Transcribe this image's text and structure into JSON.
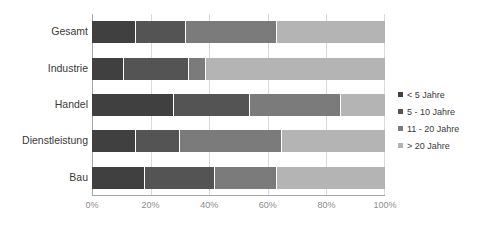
{
  "chart_data": {
    "type": "bar",
    "orientation": "horizontal",
    "stacked": true,
    "stack_mode": "percent",
    "title": "",
    "xlabel": "",
    "ylabel": "",
    "xlim": [
      0,
      100
    ],
    "xticks": [
      "0%",
      "20%",
      "40%",
      "60%",
      "80%",
      "100%"
    ],
    "xtick_values": [
      0,
      20,
      40,
      60,
      80,
      100
    ],
    "grid": true,
    "legend_position": "right",
    "categories": [
      "Gesamt",
      "Industrie",
      "Handel",
      "Dienstleistung",
      "Bau"
    ],
    "series": [
      {
        "name": "< 5 Jahre",
        "color": "#404040",
        "values": [
          15,
          11,
          28,
          15,
          18
        ]
      },
      {
        "name": "5 - 10 Jahre",
        "color": "#545454",
        "values": [
          17,
          22,
          26,
          15,
          24
        ]
      },
      {
        "name": "11 - 20 Jahre",
        "color": "#7b7b7b",
        "values": [
          31,
          6,
          31,
          35,
          21
        ]
      },
      {
        "name": "> 20 Jahre",
        "color": "#b4b4b4",
        "values": [
          37,
          61,
          15,
          35,
          37
        ]
      }
    ]
  },
  "axis": {
    "grid_color": "#d9d9d9",
    "axis_line_color": "#a6a6a6",
    "tick_label_color": "#8c8c8c",
    "category_label_color": "#3a3a3a"
  }
}
